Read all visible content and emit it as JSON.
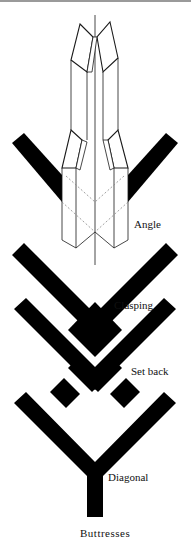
{
  "figure": {
    "title": "Buttresses",
    "labels": {
      "angle": "Angle",
      "clasping": "Clasping",
      "set_back": "Set back",
      "diagonal": "Diagonal"
    },
    "colors": {
      "wall_fill": "#000000",
      "line": "#1a1a1a",
      "background": "#ffffff",
      "rule": "#9a9a9a"
    }
  }
}
